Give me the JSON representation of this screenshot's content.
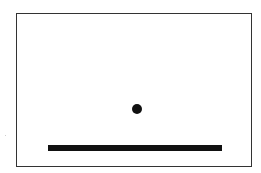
{
  "game": {
    "type": "paddle-ball",
    "colors": {
      "background": "#ffffff",
      "border": "#333333",
      "ball": "#111111",
      "paddle": "#111111"
    },
    "field": {
      "x": 16,
      "y": 13,
      "width": 236,
      "height": 154
    },
    "ball": {
      "cx": 137,
      "cy": 109,
      "r": 5
    },
    "paddle": {
      "x": 48,
      "y": 145,
      "width": 174,
      "height": 6
    }
  }
}
